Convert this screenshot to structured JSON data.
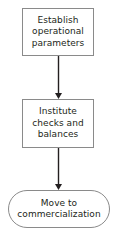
{
  "diagram": {
    "type": "flowchart",
    "orientation": "vertical",
    "background_color": "#ffffff",
    "border_color": "#8a8a8a",
    "text_color": "#231f20",
    "arrow_color": "#231f20",
    "nodes": [
      {
        "id": "establish-operational-parameters",
        "shape": "process",
        "label": "Establish\noperational\nparameters",
        "x": 22,
        "y": 8,
        "width": 72,
        "height": 48
      },
      {
        "id": "institute-checks-and-balances",
        "shape": "process",
        "label": "Institute\nchecks and\nbalances",
        "x": 22,
        "y": 99,
        "width": 72,
        "height": 49
      },
      {
        "id": "move-to-commercialization",
        "shape": "terminator",
        "label": "Move to\ncommercialization",
        "x": 8,
        "y": 190,
        "width": 102,
        "height": 38
      }
    ],
    "connectors": [
      {
        "id": "connector-1",
        "from": "establish-operational-parameters",
        "to": "institute-checks-and-balances",
        "x": 58,
        "y_start": 56,
        "y_end": 99,
        "arrowhead": "filled-triangle"
      },
      {
        "id": "connector-2",
        "from": "institute-checks-and-balances",
        "to": "move-to-commercialization",
        "x": 58,
        "y_start": 148,
        "y_end": 190,
        "arrowhead": "filled-triangle"
      }
    ]
  }
}
